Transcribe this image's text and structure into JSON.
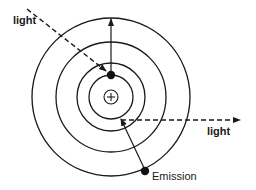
{
  "diagram": {
    "nucleus": {
      "symbol": "+",
      "cx": 111,
      "cy": 97,
      "r": 7
    },
    "orbits": [
      {
        "r": 22
      },
      {
        "r": 34
      },
      {
        "r": 55
      },
      {
        "r": 79
      }
    ],
    "labels": {
      "incoming_light": "light",
      "outgoing_light": "light",
      "emission": "Emission"
    },
    "colors": {
      "stroke": "#1a1a1a",
      "background": "#ffffff"
    }
  }
}
